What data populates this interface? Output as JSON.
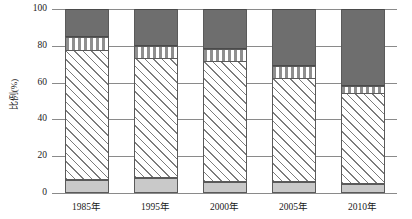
{
  "chart_data": {
    "type": "bar",
    "subtype": "stacked-percentage",
    "title": "",
    "xlabel": "",
    "ylabel": "比例(%)",
    "ylim": [
      0,
      100
    ],
    "yticks": [
      0,
      20,
      40,
      60,
      80,
      100
    ],
    "ytick_labels": [
      "0",
      "20",
      "40",
      "60",
      "80",
      "100"
    ],
    "grid": true,
    "legend": "none",
    "categories": [
      "1985年",
      "1995年",
      "2000年",
      "2005年",
      "2010年"
    ],
    "series": [
      {
        "name": "gray-bottom",
        "pattern": "solid-light-gray",
        "color": "#c9c9c9",
        "values": [
          7,
          8,
          6,
          6,
          5
        ]
      },
      {
        "name": "hatched",
        "pattern": "diagonal-hatch",
        "color": "#ffffff",
        "values": [
          70,
          65,
          65,
          56,
          49
        ]
      },
      {
        "name": "dotted",
        "pattern": "dotted-dashed",
        "color": "#ffffff",
        "values": [
          8,
          7,
          7,
          7,
          4
        ]
      },
      {
        "name": "dark-top",
        "pattern": "solid-dark-gray",
        "color": "#6e6e6e",
        "values": [
          15,
          20,
          22,
          31,
          42
        ]
      }
    ],
    "cumulative_tops": [
      [
        7,
        77,
        85,
        100
      ],
      [
        8,
        73,
        80,
        100
      ],
      [
        6,
        71,
        78,
        100
      ],
      [
        6,
        62,
        69,
        100
      ],
      [
        5,
        54,
        58,
        100
      ]
    ]
  },
  "axis": {
    "y_title": "比例(%)"
  }
}
